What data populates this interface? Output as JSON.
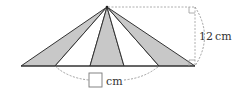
{
  "diagram": {
    "type": "geometry-fan-triangles",
    "apex": [
      107,
      7
    ],
    "baseline_y": 66,
    "base_points_x": [
      21,
      55,
      90,
      124,
      159,
      195
    ],
    "shaded_segments": [
      [
        0,
        1
      ],
      [
        2,
        3
      ],
      [
        4,
        5
      ]
    ],
    "colors": {
      "shade": "#c8c8c8",
      "stroke": "#333333",
      "dash": "#888888",
      "background": "#ffffff"
    },
    "height_label": {
      "value": "12",
      "unit": "cm",
      "text": "12 cm"
    },
    "base_label": {
      "blank_box": "",
      "unit": "cm"
    }
  }
}
